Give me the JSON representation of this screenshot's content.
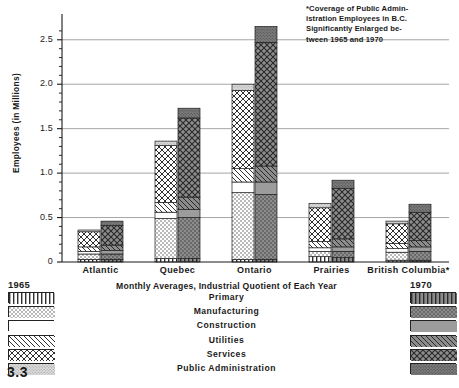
{
  "figure": {
    "number": "3.3",
    "subtitle": "Monthly Averages, Industrial Quotient of Each Year",
    "footnote_lines": [
      "*Coverage of Public Admin-",
      "istration Employees in B.C.",
      "Significantly Enlarged be-",
      "tween    1965    and    1970"
    ],
    "footnote_text": "*Coverage of Public Administration Employees in B.C. Significantly Enlarged between 1965 and 1970"
  },
  "legend": {
    "left_year": "1965",
    "right_year": "1970",
    "entries": [
      {
        "label": "Primary",
        "pattern": "vertical-lines",
        "color_1965": "#ffffff",
        "color_1970": "#8a8a8a"
      },
      {
        "label": "Manufacturing",
        "pattern": "stipple-dots",
        "color_1965": "#ffffff",
        "color_1970": "#8a8a8a"
      },
      {
        "label": "Construction",
        "pattern": "blank",
        "color_1965": "#ffffff",
        "color_1970": "#9a9a9a"
      },
      {
        "label": "Utilities",
        "pattern": "diagonal-hatch",
        "color_1965": "#ffffff",
        "color_1970": "#8a8a8a"
      },
      {
        "label": "Services",
        "pattern": "cross-hatch",
        "color_1965": "#ffffff",
        "color_1970": "#8a8a8a"
      },
      {
        "label": "Public Administration",
        "pattern": "fine-dots",
        "color_1965": "#d4d4d4",
        "color_1970": "#7a7a7a"
      }
    ]
  },
  "chart_data": {
    "type": "bar",
    "title": "",
    "subtitle": "Monthly Averages, Industrial Quotient of Each Year",
    "xlabel": "",
    "ylabel": "Employees (in Millions)",
    "ylim": [
      0,
      2.7
    ],
    "yticks": [
      0,
      0.5,
      1.0,
      1.5,
      2.0,
      2.5
    ],
    "ytick_labels": [
      "0",
      "0.5",
      "1.0",
      "1.5",
      "2.0",
      "2.5"
    ],
    "grid": true,
    "stacked": true,
    "legend_position": "bottom",
    "categories": [
      "Atlantic",
      "Quebec",
      "Ontario",
      "Prairies",
      "British Columbia*"
    ],
    "groups": [
      "1965",
      "1970"
    ],
    "segments": [
      "Primary",
      "Manufacturing",
      "Construction",
      "Utilities",
      "Services",
      "Public Administration"
    ],
    "series": [
      {
        "name": "Primary",
        "values_1965": [
          0.03,
          0.04,
          0.03,
          0.06,
          0.02
        ],
        "values_1970": [
          0.03,
          0.04,
          0.03,
          0.05,
          0.02
        ]
      },
      {
        "name": "Manufacturing",
        "values_1965": [
          0.06,
          0.45,
          0.75,
          0.06,
          0.09
        ],
        "values_1970": [
          0.06,
          0.46,
          0.73,
          0.07,
          0.1
        ]
      },
      {
        "name": "Construction",
        "values_1965": [
          0.03,
          0.07,
          0.12,
          0.04,
          0.04
        ],
        "values_1970": [
          0.04,
          0.09,
          0.14,
          0.05,
          0.05
        ]
      },
      {
        "name": "Utilities",
        "values_1965": [
          0.05,
          0.11,
          0.15,
          0.07,
          0.06
        ],
        "values_1970": [
          0.06,
          0.14,
          0.18,
          0.09,
          0.07
        ]
      },
      {
        "name": "Services",
        "values_1965": [
          0.17,
          0.64,
          0.88,
          0.38,
          0.22
        ],
        "values_1970": [
          0.22,
          0.89,
          1.39,
          0.57,
          0.32
        ]
      },
      {
        "name": "Public Administration",
        "values_1965": [
          0.02,
          0.05,
          0.07,
          0.05,
          0.03
        ],
        "values_1970": [
          0.05,
          0.11,
          0.18,
          0.09,
          0.09
        ]
      }
    ],
    "totals_1965": [
      0.36,
      1.36,
      2.0,
      0.66,
      0.46
    ],
    "totals_1970": [
      0.46,
      1.73,
      2.65,
      0.92,
      0.65
    ]
  }
}
